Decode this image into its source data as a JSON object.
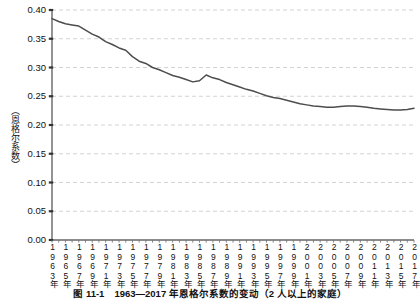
{
  "figure": {
    "caption": "图 11-1　1963—2017 年恩格尔系数的变动（2 人以上的家庭）",
    "y_axis_title": "（恩格尔系数）"
  },
  "chart_data": {
    "type": "line",
    "title": "",
    "subtitle": "",
    "xlabel": "",
    "ylabel": "（恩格尔系数）",
    "ylim": [
      0.0,
      0.4
    ],
    "xlim": [
      1963,
      2017
    ],
    "grid": true,
    "grid_style": "dashed-horizontal",
    "legend": false,
    "legend_position": "none",
    "line_color": "#4d4d4d",
    "background_color": "#ffffff",
    "ytick_labels": [
      "0.40",
      "0.35",
      "0.30",
      "0.25",
      "0.20",
      "0.15",
      "0.10",
      "0.05",
      "0.00"
    ],
    "ytick_values": [
      0.4,
      0.35,
      0.3,
      0.25,
      0.2,
      0.15,
      0.1,
      0.05,
      0.0
    ],
    "xtick_labels": [
      "1963年",
      "1965年",
      "1967年",
      "1969年",
      "1971年",
      "1973年",
      "1975年",
      "1977年",
      "1979年",
      "1981年",
      "1983年",
      "1985年",
      "1987年",
      "1989年",
      "1991年",
      "1993年",
      "1995年",
      "1997年",
      "1999年",
      "2001年",
      "2003年",
      "2005年",
      "2007年",
      "2009年",
      "2011年",
      "2013年",
      "2015年",
      "2017年"
    ],
    "xtick_values": [
      1963,
      1965,
      1967,
      1969,
      1971,
      1973,
      1975,
      1977,
      1979,
      1981,
      1983,
      1985,
      1987,
      1989,
      1991,
      1993,
      1995,
      1997,
      1999,
      2001,
      2003,
      2005,
      2007,
      2009,
      2011,
      2013,
      2015,
      2017
    ],
    "x": [
      1963,
      1964,
      1965,
      1966,
      1967,
      1968,
      1969,
      1970,
      1971,
      1972,
      1973,
      1974,
      1975,
      1976,
      1977,
      1978,
      1979,
      1980,
      1981,
      1982,
      1983,
      1984,
      1985,
      1986,
      1987,
      1988,
      1989,
      1990,
      1991,
      1992,
      1993,
      1994,
      1995,
      1996,
      1997,
      1998,
      1999,
      2000,
      2001,
      2002,
      2003,
      2004,
      2005,
      2006,
      2007,
      2008,
      2009,
      2010,
      2011,
      2012,
      2013,
      2014,
      2015,
      2016,
      2017
    ],
    "values": [
      0.385,
      0.38,
      0.376,
      0.374,
      0.372,
      0.365,
      0.358,
      0.353,
      0.345,
      0.34,
      0.334,
      0.33,
      0.319,
      0.311,
      0.307,
      0.3,
      0.296,
      0.291,
      0.286,
      0.283,
      0.279,
      0.275,
      0.277,
      0.287,
      0.282,
      0.279,
      0.274,
      0.27,
      0.266,
      0.262,
      0.259,
      0.255,
      0.251,
      0.248,
      0.246,
      0.243,
      0.24,
      0.237,
      0.235,
      0.233,
      0.232,
      0.231,
      0.231,
      0.232,
      0.233,
      0.233,
      0.232,
      0.231,
      0.229,
      0.228,
      0.227,
      0.226,
      0.226,
      0.227,
      0.229
    ],
    "series": [
      {
        "name": "恩格尔系数",
        "values": [
          0.385,
          0.38,
          0.376,
          0.374,
          0.372,
          0.365,
          0.358,
          0.353,
          0.345,
          0.34,
          0.334,
          0.33,
          0.319,
          0.311,
          0.307,
          0.3,
          0.296,
          0.291,
          0.286,
          0.283,
          0.279,
          0.275,
          0.277,
          0.287,
          0.282,
          0.279,
          0.274,
          0.27,
          0.266,
          0.262,
          0.259,
          0.255,
          0.251,
          0.248,
          0.246,
          0.243,
          0.24,
          0.237,
          0.235,
          0.233,
          0.232,
          0.231,
          0.231,
          0.232,
          0.233,
          0.233,
          0.232,
          0.231,
          0.229,
          0.228,
          0.227,
          0.226,
          0.226,
          0.227,
          0.229
        ]
      }
    ],
    "annotations": []
  }
}
